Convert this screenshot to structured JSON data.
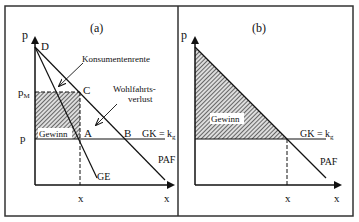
{
  "panels": [
    {
      "title": "(a)",
      "y_axis": "p",
      "x_axis": "x",
      "labels": {
        "D": "D",
        "C": "C",
        "A": "A",
        "B": "B",
        "pM": "p",
        "pM_sub": "M",
        "p": "p",
        "x_tick": "x",
        "consumer_surplus": "Konsumentenrente",
        "deadweight_line1": "Wohlfahrts-",
        "deadweight_line2": "verlust",
        "profit": "Gewinn",
        "cost_curve": "GK = k",
        "cost_curve_sub": "g",
        "demand": "PAF",
        "marginal_revenue": "GE"
      }
    },
    {
      "title": "(b)",
      "y_axis": "p",
      "x_axis": "x",
      "labels": {
        "profit": "Gewinn",
        "cost_curve": "GK = k",
        "cost_curve_sub": "g",
        "demand": "PAF",
        "x_tick": "x"
      }
    }
  ]
}
